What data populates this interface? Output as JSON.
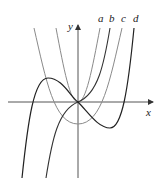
{
  "figure": {
    "axes": {
      "x_label": "x",
      "y_label": "y"
    },
    "curves": [
      {
        "label": "a",
        "color": "#8a8a8a"
      },
      {
        "label": "b",
        "color": "#333333"
      },
      {
        "label": "c",
        "color": "#8a8a8a"
      },
      {
        "label": "d",
        "color": "#222222"
      }
    ]
  }
}
